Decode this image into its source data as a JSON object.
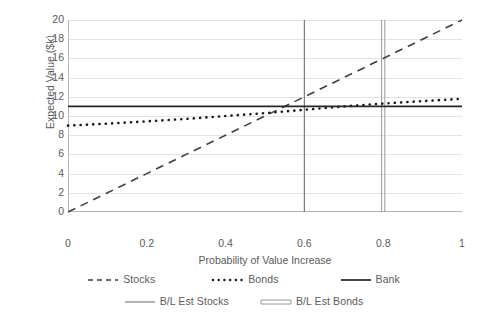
{
  "chart_data": {
    "type": "line",
    "title": "",
    "xlabel": "Probability of Value Increase",
    "ylabel": "Expected Value ($k)",
    "xlim": [
      0,
      1
    ],
    "ylim": [
      0,
      20
    ],
    "xticks": [
      "0",
      "0.2",
      "0.4",
      "0.6",
      "0.8",
      "1"
    ],
    "xtick_values": [
      0,
      0.2,
      0.4,
      0.6,
      0.8,
      1
    ],
    "yticks": [
      "0",
      "2",
      "4",
      "6",
      "8",
      "10",
      "12",
      "14",
      "16",
      "18",
      "20"
    ],
    "ytick_values": [
      0,
      2,
      4,
      6,
      8,
      10,
      12,
      14,
      16,
      18,
      20
    ],
    "grid": "horizontal",
    "legend_position": "bottom",
    "series": [
      {
        "name": "Stocks",
        "style": "dashed",
        "color": "#404040",
        "x": [
          0,
          0.1,
          0.2,
          0.3,
          0.4,
          0.5,
          0.6,
          0.7,
          0.8,
          0.9,
          1
        ],
        "values": [
          0,
          2,
          4,
          6,
          8,
          10,
          12,
          14,
          16,
          18,
          20
        ]
      },
      {
        "name": "Bonds",
        "style": "dotted",
        "color": "#1a1a1a",
        "x": [
          0,
          0.1,
          0.2,
          0.3,
          0.4,
          0.5,
          0.6,
          0.7,
          0.8,
          0.9,
          1
        ],
        "values": [
          9.0,
          9.2,
          9.45,
          9.7,
          10.0,
          10.3,
          10.65,
          11.0,
          11.3,
          11.55,
          11.8
        ]
      },
      {
        "name": "Bank",
        "style": "solid",
        "color": "#262626",
        "x": [
          0,
          1
        ],
        "values": [
          11,
          11
        ]
      }
    ],
    "vertical_markers": [
      {
        "name": "B/L Est Stocks",
        "style": "solid",
        "color": "#808080",
        "x": 0.6
      },
      {
        "name": "B/L Est Bonds",
        "style": "double",
        "color": "#9a9a9a",
        "x": 0.8
      }
    ]
  },
  "legend": {
    "row1": [
      {
        "label": "Stocks",
        "icon": "dashed-line-icon"
      },
      {
        "label": "Bonds",
        "icon": "dotted-line-icon"
      },
      {
        "label": "Bank",
        "icon": "solid-line-icon"
      }
    ],
    "row2": [
      {
        "label": "B/L  Est Stocks",
        "icon": "thin-solid-line-icon"
      },
      {
        "label": "B/L  Est Bonds",
        "icon": "double-line-icon"
      }
    ]
  }
}
